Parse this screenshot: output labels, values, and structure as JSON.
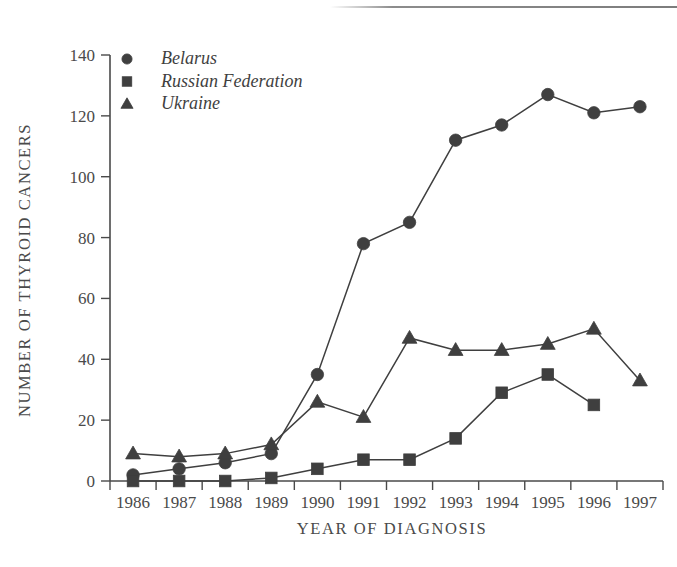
{
  "chart_data": {
    "type": "line",
    "title": "",
    "xlabel": "YEAR OF DIAGNOSIS",
    "ylabel": "NUMBER OF THYROID CANCERS",
    "categories": [
      "1986",
      "1987",
      "1988",
      "1989",
      "1990",
      "1991",
      "1992",
      "1993",
      "1994",
      "1995",
      "1996",
      "1997"
    ],
    "x": [
      1986,
      1987,
      1988,
      1989,
      1990,
      1991,
      1992,
      1993,
      1994,
      1995,
      1996,
      1997
    ],
    "xlim": [
      1985.5,
      1997.5
    ],
    "ylim": [
      0,
      140
    ],
    "yticks": [
      0,
      20,
      40,
      60,
      80,
      100,
      120,
      140
    ],
    "ytick_labels": [
      "0",
      "20",
      "40",
      "60",
      "80",
      "100",
      "120",
      "140"
    ],
    "grid": false,
    "legend_position": "top-left",
    "series": [
      {
        "name": "Belarus",
        "marker": "circle",
        "color": "#3f3f3f",
        "values": [
          2,
          4,
          6,
          9,
          35,
          78,
          85,
          112,
          117,
          127,
          121,
          123
        ]
      },
      {
        "name": "Russian Federation",
        "marker": "square",
        "color": "#3f3f3f",
        "values": [
          0,
          0,
          0,
          1,
          4,
          7,
          7,
          14,
          29,
          35,
          25,
          null
        ]
      },
      {
        "name": "Ukraine",
        "marker": "triangle",
        "color": "#3f3f3f",
        "values": [
          9,
          8,
          9,
          12,
          26,
          21,
          47,
          43,
          43,
          45,
          50,
          33
        ]
      }
    ]
  },
  "legend": {
    "entries": [
      {
        "label": "Belarus",
        "marker": "circle"
      },
      {
        "label": "Russian Federation",
        "marker": "square"
      },
      {
        "label": "Ukraine",
        "marker": "triangle"
      }
    ]
  },
  "axes": {
    "x_title": "YEAR OF DIAGNOSIS",
    "y_title": "NUMBER OF THYROID CANCERS"
  }
}
